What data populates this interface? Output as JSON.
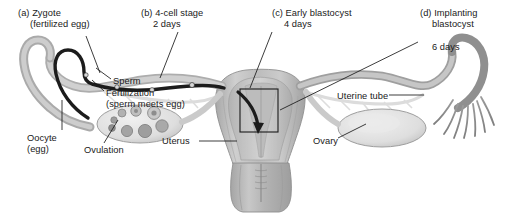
{
  "figure": {
    "background_color": "#ffffff",
    "ink_color": "#1a1a1a"
  },
  "stage_labels": [
    {
      "key": "a",
      "marker": "(a) Zygote",
      "detail": "(fertilized egg)",
      "time": "",
      "name": "stage-label-zygote"
    },
    {
      "key": "b",
      "marker": "(b) 4-cell stage",
      "detail": "2 days",
      "time": "2 days",
      "name": "stage-label-four-cell"
    },
    {
      "key": "c",
      "marker": "(c) Early blastocyst",
      "detail": "4 days",
      "time": "4 days",
      "name": "stage-label-early-blastocyst"
    },
    {
      "key": "d",
      "marker": "(d) Implanting",
      "detail": "blastocyst",
      "time": "6 days",
      "name": "stage-label-implanting-blastocyst"
    }
  ],
  "part_labels": {
    "sperm": "Sperm",
    "fertilization": "Fertilization",
    "fertilization_detail": "(sperm meets egg)",
    "oocyte": "Oocyte",
    "oocyte_detail": "(egg)",
    "ovulation": "Ovulation",
    "uterus": "Uterus",
    "uterine_tube": "Uterine tube",
    "ovary": "Ovary"
  },
  "anatomy_colors": {
    "organ_fill_light": "#d8d8d8",
    "organ_fill_mid": "#b9b9b9",
    "organ_fill_dark": "#9a9a9a",
    "organ_outline": "#8a8a8a",
    "tube_lumen": "#c9c9c9",
    "ovary_fill": "#e3e3e3",
    "embryo_path": "#1c1c1c",
    "leader_line": "#1a1a1a",
    "inset_box": "#1a1a1a"
  },
  "embryo_path": {
    "description": "Dark band running from left ovary along left uterine tube into uterine cavity",
    "stage_markers": 4
  },
  "left_ovary_follicles": 8,
  "inset_box": {
    "description": "Rectangular magnification box over the uterine wall at implantation site"
  }
}
